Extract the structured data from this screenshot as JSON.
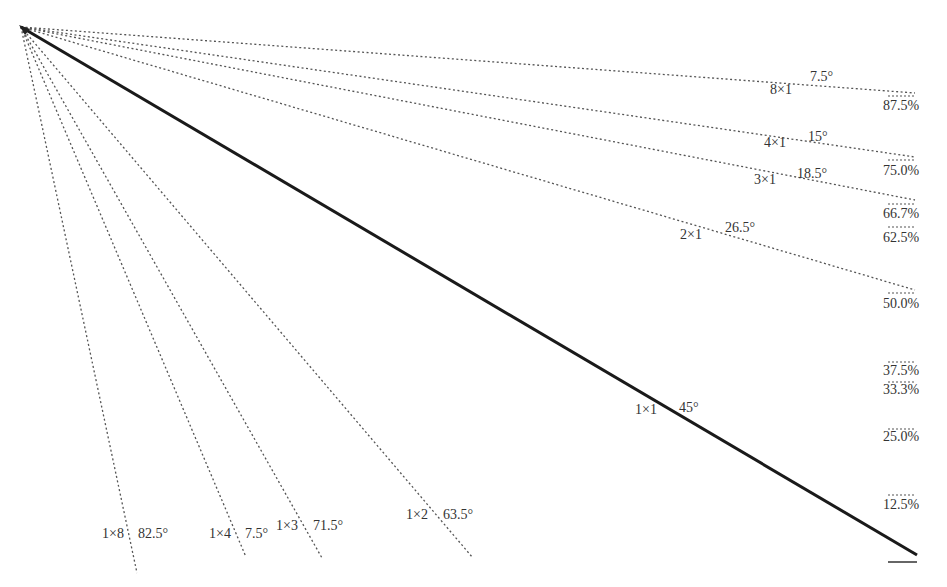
{
  "diagram": {
    "title": "",
    "origin": [
      21,
      27
    ],
    "lines": [
      {
        "ratio": "8×1",
        "angle": "7.5°",
        "end": [
          915,
          93
        ],
        "style": "dotted"
      },
      {
        "ratio": "4×1",
        "angle": "15°",
        "end": [
          915,
          157
        ],
        "style": "dotted"
      },
      {
        "ratio": "3×1",
        "angle": "18.5°",
        "end": [
          915,
          200
        ],
        "style": "dotted"
      },
      {
        "ratio": "2×1",
        "angle": "26.5°",
        "end": [
          915,
          290
        ],
        "style": "dotted"
      },
      {
        "ratio": "1×1",
        "angle": "45°",
        "end": [
          917,
          555
        ],
        "style": "solid"
      },
      {
        "ratio": "1×2",
        "angle": "63.5°",
        "end": [
          473,
          558
        ],
        "style": "dotted"
      },
      {
        "ratio": "1×3",
        "angle": "71.5°",
        "end": [
          322,
          558
        ],
        "style": "dotted"
      },
      {
        "ratio": "1×4",
        "angle": "7.5°",
        "end": [
          246,
          557
        ],
        "style": "dotted"
      },
      {
        "ratio": "1×8",
        "angle": "82.5°",
        "end": [
          137,
          573
        ],
        "style": "dotted"
      }
    ],
    "percentages": [
      {
        "label": "87.5%",
        "y": 105
      },
      {
        "label": "75.0%",
        "y": 168
      },
      {
        "label": "66.7%",
        "y": 211
      },
      {
        "label": "62.5%",
        "y": 235
      },
      {
        "label": "50.0%",
        "y": 301
      },
      {
        "label": "37.5%",
        "y": 366
      },
      {
        "label": "33.3%",
        "y": 386
      },
      {
        "label": "25.0%",
        "y": 433
      },
      {
        "label": "12.5%",
        "y": 500
      }
    ]
  },
  "labels": {
    "r8x1": "8×1",
    "a8x1": "7.5°",
    "r4x1": "4×1",
    "a4x1": "15°",
    "r3x1": "3×1",
    "a3x1": "18.5°",
    "r2x1": "2×1",
    "a2x1": "26.5°",
    "r1x1": "1×1",
    "a1x1": "45°",
    "r1x2": "1×2",
    "a1x2": "63.5°",
    "r1x3": "1×3",
    "a1x3": "71.5°",
    "r1x4": "1×4",
    "a1x4": "7.5°",
    "r1x8": "1×8",
    "a1x8": "82.5°",
    "p875": "87.5%",
    "p750": "75.0%",
    "p667": "66.7%",
    "p625": "62.5%",
    "p500": "50.0%",
    "p375": "37.5%",
    "p333": "33.3%",
    "p250": "25.0%",
    "p125": "12.5%"
  },
  "colors": {
    "line": "#222222",
    "dotted": "#555555",
    "text": "#333333"
  }
}
